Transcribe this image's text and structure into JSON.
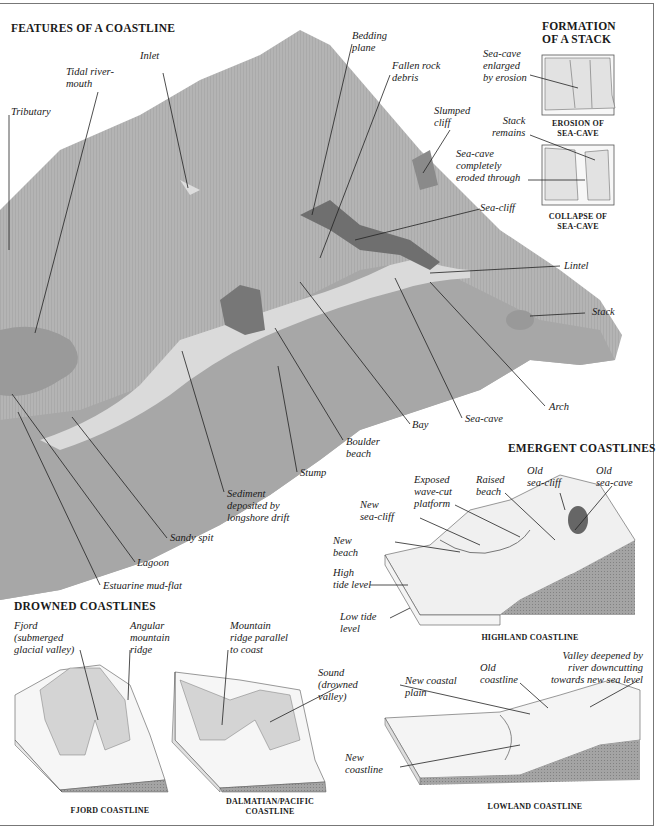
{
  "main_diagram": {
    "title": "FEATURES OF A COASTLINE",
    "labels": {
      "inlet": "Inlet",
      "tidal_river_mouth": "Tidal river-\nmouth",
      "tributary": "Tributary",
      "bedding_plane": "Bedding\nplane",
      "fallen_rock_debris": "Fallen rock\ndebris",
      "slumped_cliff": "Slumped\ncliff",
      "sea_cliff": "Sea-cliff",
      "lintel": "Lintel",
      "stack": "Stack",
      "arch": "Arch",
      "sea_cave": "Sea-cave",
      "bay": "Bay",
      "boulder_beach": "Boulder\nbeach",
      "stump": "Stump",
      "sediment": "Sediment\ndeposited by\nlongshore drift",
      "sandy_spit": "Sandy spit",
      "lagoon": "Lagoon",
      "estuarine_mud_flat": "Estuarine mud-flat"
    }
  },
  "stack_formation": {
    "title": "FORMATION\nOF A STACK",
    "panel1": {
      "label": "Sea-cave\nenlarged\nby erosion",
      "caption": "EROSION OF\nSEA-CAVE"
    },
    "panel2": {
      "label_top": "Stack\nremains",
      "label_mid": "Sea-cave\ncompletely\neroded through",
      "caption": "COLLAPSE OF\nSEA-CAVE"
    }
  },
  "emergent": {
    "title": "EMERGENT COASTLINES",
    "highland": {
      "caption": "HIGHLAND COASTLINE",
      "labels": {
        "exposed_platform": "Exposed\nwave-cut\nplatform",
        "raised_beach": "Raised\nbeach",
        "old_sea_cliff": "Old\nsea-cliff",
        "old_sea_cave": "Old\nsea-cave",
        "new_sea_cliff": "New\nsea-cliff",
        "new_beach": "New\nbeach",
        "high_tide": "High\ntide level",
        "low_tide": "Low tide\nlevel"
      }
    },
    "lowland": {
      "caption": "LOWLAND COASTLINE",
      "labels": {
        "new_coastal_plain": "New coastal\nplain",
        "old_coastline": "Old\ncoastline",
        "valley_deepened": "Valley deepened by\nriver downcutting\ntowards new sea level",
        "new_coastline": "New\ncoastline"
      }
    }
  },
  "drowned": {
    "title": "DROWNED COASTLINES",
    "fjord": {
      "caption": "FJORD COASTLINE",
      "labels": {
        "fjord": "Fjord\n(submerged\nglacial valley)",
        "angular_ridge": "Angular\nmountain\nridge"
      }
    },
    "dalmatian": {
      "caption": "DALMATIAN/PACIFIC\nCOASTLINE",
      "labels": {
        "mountain_ridge": "Mountain\nridge parallel\nto coast",
        "sound": "Sound\n(drowned\nvalley)"
      }
    }
  },
  "colors": {
    "land": "#b4b4b4",
    "land_dark": "#8e8e8e",
    "sand": "#d9d9d9",
    "sea_block": "#9c9c9c",
    "frame": "#777777"
  }
}
